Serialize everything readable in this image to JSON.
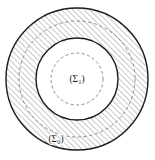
{
  "figure": {
    "background_color": "#ffffff",
    "stroke_color": "#1b1b1b",
    "hatch_color": "#9a9a9a",
    "dash_color": "#8c8c8c",
    "fill_color": "#ffffff",
    "center": {
      "x": 77,
      "y": 79
    },
    "labels": {
      "inner": {
        "text": "(Σ",
        "subscript": "1",
        "close": ")",
        "full": "(Σ₁)",
        "x": 77,
        "y": 81
      },
      "outer": {
        "text": "(Σ",
        "subscript": "0",
        "close": ")",
        "full": "(Σ₀)",
        "x": 56,
        "y": 141
      }
    },
    "circles": [
      {
        "name": "outer-boundary",
        "style": "solid",
        "radius": 71,
        "stroke_width": 1.4,
        "hatched": true
      },
      {
        "name": "outer-dashed",
        "style": "dashed",
        "radius": 58,
        "stroke_width": 1.0,
        "hatched": false
      },
      {
        "name": "middle-boundary",
        "style": "solid",
        "radius": 41,
        "stroke_width": 1.4,
        "hatched": false
      },
      {
        "name": "inner-dashed",
        "style": "dashed",
        "radius": 26,
        "stroke_width": 1.0,
        "hatched": false
      }
    ]
  }
}
